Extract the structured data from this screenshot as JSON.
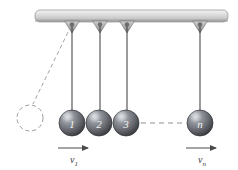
{
  "figure": {
    "background_color": "#ffffff"
  },
  "support": {
    "name": "ceiling-bar",
    "fill_top": "#e8e8e8",
    "fill_bottom": "#b4b4b4",
    "edge_color": "#8c8c8c",
    "x": 35,
    "y": 10,
    "width": 193,
    "height": 12
  },
  "pivots": [
    {
      "id": "pivot-1",
      "x": 72,
      "y": 21
    },
    {
      "id": "pivot-2",
      "x": 100,
      "y": 21
    },
    {
      "id": "pivot-3",
      "x": 127,
      "y": 21
    },
    {
      "id": "pivot-n",
      "x": 200,
      "y": 21
    }
  ],
  "strings": [
    {
      "id": "string-1",
      "x1": 72,
      "y1": 22,
      "x2": 72,
      "y2": 110,
      "style": "solid"
    },
    {
      "id": "string-2",
      "x1": 100,
      "y1": 22,
      "x2": 100,
      "y2": 110,
      "style": "solid"
    },
    {
      "id": "string-3",
      "x1": 127,
      "y1": 22,
      "x2": 127,
      "y2": 110,
      "style": "solid"
    },
    {
      "id": "string-n",
      "x1": 200,
      "y1": 22,
      "x2": 200,
      "y2": 110,
      "style": "solid"
    },
    {
      "id": "string-raised",
      "x1": 72,
      "y1": 24,
      "x2": 33,
      "y2": 103,
      "style": "dashed"
    }
  ],
  "balls": [
    {
      "id": "ball-1",
      "label": "1",
      "cx": 72,
      "cy": 123,
      "r": 13
    },
    {
      "id": "ball-2",
      "label": "2",
      "cx": 99,
      "cy": 123,
      "r": 13
    },
    {
      "id": "ball-3",
      "label": "3",
      "cx": 126,
      "cy": 123,
      "r": 13
    },
    {
      "id": "ball-n",
      "label": "n",
      "cx": 200,
      "cy": 123,
      "r": 13
    }
  ],
  "ball_style": {
    "highlight_color": "#b9bcc2",
    "mid_color": "#7d8086",
    "shadow_color": "#3b3d42",
    "outline_color": "#2e3034"
  },
  "ghost_ball": {
    "id": "ghost-ball",
    "label": "",
    "cx": 30,
    "cy": 118,
    "r": 13,
    "stroke_color": "#9a9a9a",
    "style": "dashed"
  },
  "connector": {
    "id": "ellipsis-connector",
    "x1": 140,
    "y1": 123,
    "x2": 186,
    "y2": 123,
    "style": "dashed",
    "color": "#8e8e8e"
  },
  "velocity_arrows": [
    {
      "id": "velocity-arrow-1",
      "x1": 58,
      "x2": 90,
      "y": 148,
      "symbol": "v",
      "subscript": "1",
      "label_x": 74,
      "label_y": 163
    },
    {
      "id": "velocity-arrow-n",
      "x1": 186,
      "x2": 218,
      "y": 148,
      "symbol": "v",
      "subscript": "n",
      "label_x": 202,
      "label_y": 163
    }
  ],
  "colors": {
    "line": "#4a4a4a",
    "dash": "#9a9a9a",
    "text": "#3a3a3a"
  }
}
